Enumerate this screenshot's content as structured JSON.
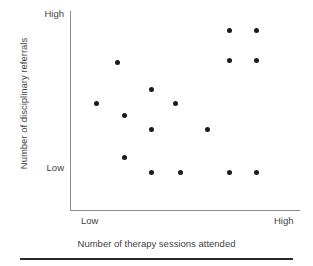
{
  "chart_data": {
    "type": "scatter",
    "title": "",
    "xlabel": "Number of therapy sessions attended",
    "ylabel": "Number of disciplinary referrals",
    "x_tick_labels": [
      "Low",
      "High"
    ],
    "y_tick_labels": [
      "Low",
      "High"
    ],
    "xlim": [
      0,
      100
    ],
    "ylim": [
      0,
      100
    ],
    "grid": false,
    "legend": "none",
    "marker": "filled-circle",
    "marker_color": "#1a1a1a",
    "axis_color": "#8a8a8a",
    "points": [
      {
        "x": 11,
        "y": 67,
        "label": "point-1"
      },
      {
        "x": 22,
        "y": 81,
        "label": "point-2"
      },
      {
        "x": 26,
        "y": 58,
        "label": "point-3"
      },
      {
        "x": 26,
        "y": 34,
        "label": "point-4"
      },
      {
        "x": 40,
        "y": 73,
        "label": "point-5"
      },
      {
        "x": 40,
        "y": 51,
        "label": "point-6"
      },
      {
        "x": 40,
        "y": 24,
        "label": "point-7"
      },
      {
        "x": 55,
        "y": 67,
        "label": "point-8"
      },
      {
        "x": 55,
        "y": 24,
        "label": "point-9"
      },
      {
        "x": 69,
        "y": 51,
        "label": "point-10"
      },
      {
        "x": 81,
        "y": 93,
        "label": "point-11"
      },
      {
        "x": 81,
        "y": 79,
        "label": "point-12"
      },
      {
        "x": 81,
        "y": 24,
        "label": "point-13"
      },
      {
        "x": 94,
        "y": 93,
        "label": "point-14"
      },
      {
        "x": 94,
        "y": 79,
        "label": "point-15"
      },
      {
        "x": 94,
        "y": 24,
        "label": "point-16"
      }
    ],
    "point_pixels": [
      {
        "px": 96,
        "py": 103
      },
      {
        "px": 117,
        "py": 62
      },
      {
        "px": 124,
        "py": 115
      },
      {
        "px": 124,
        "py": 157
      },
      {
        "px": 151,
        "py": 89
      },
      {
        "px": 151,
        "py": 129
      },
      {
        "px": 151,
        "py": 172
      },
      {
        "px": 175,
        "py": 103
      },
      {
        "px": 180,
        "py": 172
      },
      {
        "px": 207,
        "py": 129
      },
      {
        "px": 229,
        "py": 30
      },
      {
        "px": 229,
        "py": 60
      },
      {
        "px": 229,
        "py": 172
      },
      {
        "px": 256,
        "py": 30
      },
      {
        "px": 256,
        "py": 60
      },
      {
        "px": 256,
        "py": 172
      }
    ]
  },
  "axes": {
    "y_title": "Number of disciplinary referrals",
    "x_title": "Number of therapy sessions attended",
    "y_high": "High",
    "y_low": "Low",
    "x_low": "Low",
    "x_high": "High"
  }
}
